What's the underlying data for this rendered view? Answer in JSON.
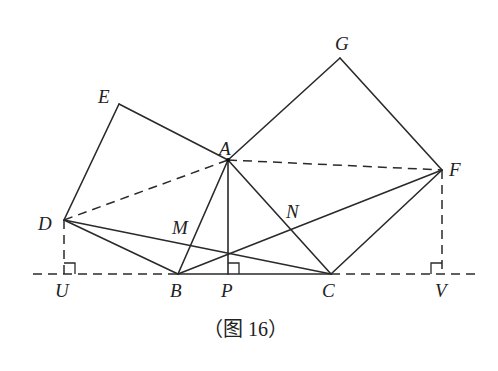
{
  "caption": "（图 16）",
  "colors": {
    "stroke": "#2a2a2a",
    "background": "#ffffff"
  },
  "points": {
    "A": {
      "label": "A",
      "x": 228,
      "y": 160
    },
    "B": {
      "label": "B",
      "x": 178,
      "y": 274
    },
    "C": {
      "label": "C",
      "x": 331,
      "y": 274
    },
    "D": {
      "label": "D",
      "x": 64,
      "y": 220
    },
    "E": {
      "label": "E",
      "x": 119,
      "y": 104
    },
    "F": {
      "label": "F",
      "x": 442,
      "y": 170
    },
    "G": {
      "label": "G",
      "x": 340,
      "y": 58
    },
    "M": {
      "label": "M",
      "x": 191,
      "y": 245
    },
    "N": {
      "label": "N",
      "x": 291,
      "y": 229
    },
    "P": {
      "label": "P",
      "x": 228,
      "y": 274
    },
    "U": {
      "label": "U",
      "x": 64,
      "y": 274
    },
    "V": {
      "label": "V",
      "x": 442,
      "y": 274
    }
  },
  "solid_segments": [
    "D-E",
    "E-A",
    "A-B",
    "A-G",
    "G-F",
    "F-C",
    "A-C",
    "A-P",
    "B-C",
    "D-B",
    "D-C",
    "B-F"
  ],
  "dashed_segments": [
    "D-A",
    "A-F",
    "D-U",
    "F-V",
    "baseline"
  ],
  "right_angle_marks": [
    "U",
    "P",
    "V"
  ]
}
